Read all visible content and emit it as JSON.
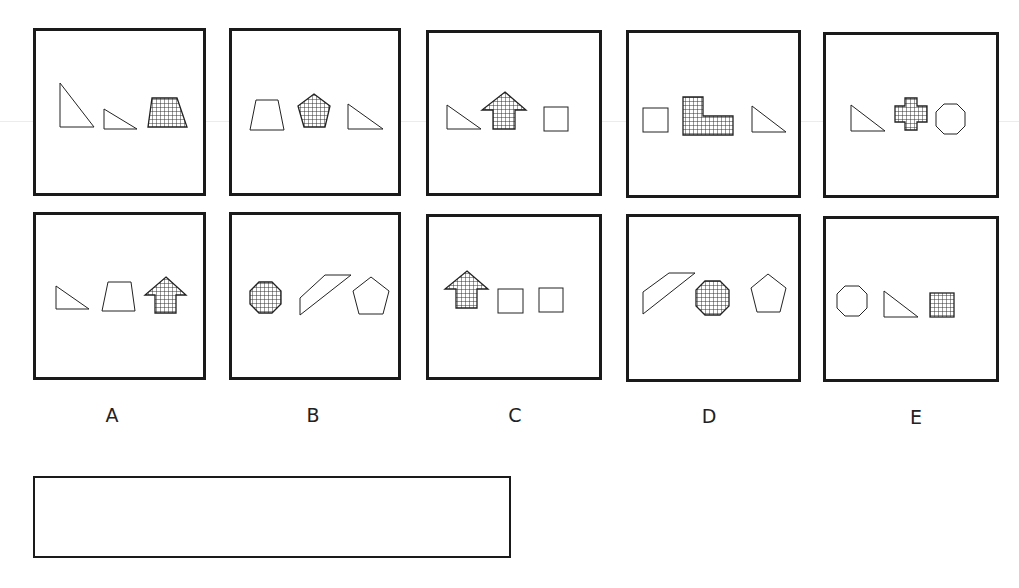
{
  "puzzle": {
    "columns": [
      {
        "label": "A",
        "top": {
          "shapes": [
            {
              "type": "right-triangle-tall",
              "fill": "outline"
            },
            {
              "type": "right-triangle-small",
              "fill": "outline"
            },
            {
              "type": "trapezoid",
              "fill": "grid"
            }
          ]
        },
        "bottom": {
          "shapes": [
            {
              "type": "right-triangle",
              "fill": "outline"
            },
            {
              "type": "trapezoid",
              "fill": "outline"
            },
            {
              "type": "arrow-up",
              "fill": "grid"
            }
          ]
        }
      },
      {
        "label": "B",
        "top": {
          "shapes": [
            {
              "type": "trapezoid",
              "fill": "outline"
            },
            {
              "type": "pentagon",
              "fill": "grid"
            },
            {
              "type": "right-triangle",
              "fill": "outline"
            }
          ]
        },
        "bottom": {
          "shapes": [
            {
              "type": "octagon",
              "fill": "grid"
            },
            {
              "type": "parallelogram",
              "fill": "outline"
            },
            {
              "type": "pentagon",
              "fill": "outline"
            }
          ]
        }
      },
      {
        "label": "C",
        "top": {
          "shapes": [
            {
              "type": "right-triangle",
              "fill": "outline"
            },
            {
              "type": "arrow-up",
              "fill": "grid"
            },
            {
              "type": "square",
              "fill": "outline"
            }
          ]
        },
        "bottom": {
          "shapes": [
            {
              "type": "arrow-up",
              "fill": "grid"
            },
            {
              "type": "square",
              "fill": "outline"
            },
            {
              "type": "square",
              "fill": "outline"
            }
          ]
        }
      },
      {
        "label": "D",
        "top": {
          "shapes": [
            {
              "type": "square",
              "fill": "outline"
            },
            {
              "type": "l-shape",
              "fill": "grid"
            },
            {
              "type": "right-triangle",
              "fill": "outline"
            }
          ]
        },
        "bottom": {
          "shapes": [
            {
              "type": "parallelogram",
              "fill": "outline"
            },
            {
              "type": "octagon",
              "fill": "grid"
            },
            {
              "type": "pentagon",
              "fill": "outline"
            }
          ]
        }
      },
      {
        "label": "E",
        "top": {
          "shapes": [
            {
              "type": "right-triangle",
              "fill": "outline"
            },
            {
              "type": "cross",
              "fill": "grid"
            },
            {
              "type": "octagon",
              "fill": "outline"
            }
          ]
        },
        "bottom": {
          "shapes": [
            {
              "type": "octagon",
              "fill": "outline"
            },
            {
              "type": "right-triangle",
              "fill": "outline"
            },
            {
              "type": "square",
              "fill": "grid"
            }
          ]
        }
      }
    ],
    "answer_box": {
      "value": ""
    }
  },
  "colors": {
    "stroke": "#1a1a1a",
    "grid": "#333333",
    "background": "#ffffff"
  }
}
